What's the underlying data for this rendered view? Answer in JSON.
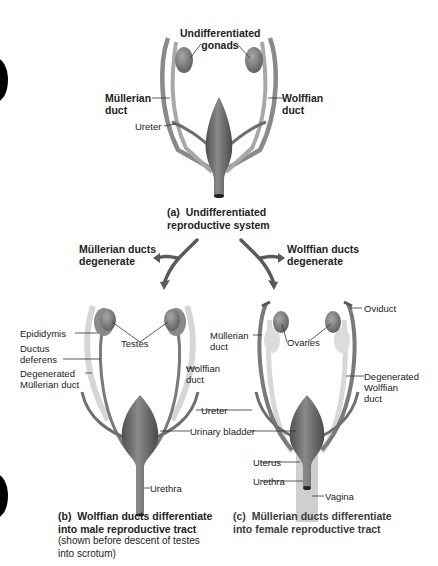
{
  "figure": {
    "panel_a": {
      "labels": {
        "gonads": "Undifferentiated\ngonads",
        "gonads_line1": "Undifferentiated",
        "gonads_line2": "gonads",
        "mullerian_line1": "Müllerian",
        "mullerian_line2": "duct",
        "wolffian_line1": "Wolffian",
        "wolffian_line2": "duct",
        "ureter": "Ureter"
      },
      "caption_letter": "(a)",
      "caption_line1": "Undifferentiated",
      "caption_line2": "reproductive system"
    },
    "branches": {
      "left_line1": "Müllerian ducts",
      "left_line2": "degenerate",
      "right_line1": "Wolffian ducts",
      "right_line2": "degenerate"
    },
    "panel_b": {
      "labels": {
        "epididymis": "Epididymis",
        "ductus_line1": "Ductus",
        "ductus_line2": "deferens",
        "degen_line1": "Degenerated",
        "degen_line2": "Müllerian duct",
        "testes": "Testes",
        "wolffian_line1": "Wolffian",
        "wolffian_line2": "duct",
        "urethra": "Urethra"
      },
      "caption_letter": "(b)",
      "caption_line1": "Wolffian ducts differentiate",
      "caption_line2": "into male reproductive tract",
      "caption_note1": "(shown before descent of testes",
      "caption_note2": "into scrotum)"
    },
    "shared_labels": {
      "ureter": "Ureter",
      "urinary_bladder": "Urinary bladder"
    },
    "panel_c": {
      "labels": {
        "oviduct": "Oviduct",
        "mullerian_line1": "Müllerian",
        "mullerian_line2": "duct",
        "ovaries": "Ovaries",
        "degen_line1": "Degenerated",
        "degen_line2": "Wolffian",
        "degen_line3": "duct",
        "uterus": "Uterus",
        "urethra": "Urethra",
        "vagina": "Vagina"
      },
      "caption_letter": "(c)",
      "caption_line1": "Müllerian ducts differentiate",
      "caption_line2": "into female reproductive tract"
    }
  },
  "colors": {
    "organ_dark": "#6e6e6e",
    "organ_mid": "#8c8c8c",
    "duct_light": "#d4d4d4",
    "arrow": "#5a5a5a",
    "tab_marker": "#000000"
  }
}
